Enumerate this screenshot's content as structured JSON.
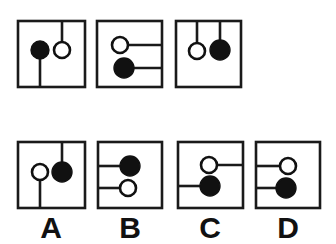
{
  "page": {
    "background_color": "#ffffff",
    "line_color": "#1a1a1a",
    "filled_node_color": "#111111",
    "open_node_color": "#ffffff"
  },
  "prompt_row": {
    "name": "question-row",
    "panels": [
      {
        "id": "q1",
        "box": {
          "x": 18,
          "y": 21,
          "w": 67,
          "h": 66
        },
        "elements": [
          {
            "kind": "line",
            "orientation": "vertical",
            "from_edge": "none",
            "to_edge": "bottom",
            "x": 40,
            "y1": 50,
            "y2": 87
          },
          {
            "kind": "line",
            "orientation": "vertical",
            "from_edge": "top",
            "to_edge": "none",
            "x": 62,
            "y1": 21,
            "y2": 50
          },
          {
            "kind": "circle",
            "fill": "filled",
            "cx": 40,
            "cy": 50,
            "r": 9
          },
          {
            "kind": "circle",
            "fill": "open",
            "cx": 62,
            "cy": 50,
            "r": 8
          }
        ]
      },
      {
        "id": "q2",
        "box": {
          "x": 97,
          "y": 21,
          "w": 65,
          "h": 66
        },
        "elements": [
          {
            "kind": "line",
            "orientation": "horizontal",
            "from_edge": "none",
            "to_edge": "right",
            "y": 45,
            "x1": 120,
            "x2": 162
          },
          {
            "kind": "line",
            "orientation": "horizontal",
            "from_edge": "none",
            "to_edge": "right",
            "y": 68,
            "x1": 124,
            "x2": 162
          },
          {
            "kind": "circle",
            "fill": "open",
            "cx": 120,
            "cy": 45,
            "r": 8
          },
          {
            "kind": "circle",
            "fill": "filled",
            "cx": 124,
            "cy": 68,
            "r": 10
          }
        ]
      },
      {
        "id": "q3",
        "box": {
          "x": 176,
          "y": 21,
          "w": 65,
          "h": 66
        },
        "elements": [
          {
            "kind": "line",
            "orientation": "vertical",
            "from_edge": "top",
            "to_edge": "none",
            "x": 197,
            "y1": 21,
            "y2": 51
          },
          {
            "kind": "line",
            "orientation": "vertical",
            "from_edge": "top",
            "to_edge": "none",
            "x": 220,
            "y1": 21,
            "y2": 50
          },
          {
            "kind": "circle",
            "fill": "open",
            "cx": 197,
            "cy": 51,
            "r": 8
          },
          {
            "kind": "circle",
            "fill": "filled",
            "cx": 220,
            "cy": 50,
            "r": 10
          }
        ]
      }
    ]
  },
  "answer_row": {
    "name": "answer-options-row",
    "options": [
      {
        "id": "A",
        "label": "A",
        "label_x": 51,
        "label_y": 238,
        "box": {
          "x": 18,
          "y": 142,
          "w": 67,
          "h": 66
        },
        "elements": [
          {
            "kind": "line",
            "orientation": "vertical",
            "from_edge": "none",
            "to_edge": "bottom",
            "x": 40,
            "y1": 172,
            "y2": 208
          },
          {
            "kind": "line",
            "orientation": "vertical",
            "from_edge": "top",
            "to_edge": "none",
            "x": 62,
            "y1": 142,
            "y2": 172
          },
          {
            "kind": "circle",
            "fill": "open",
            "cx": 40,
            "cy": 172,
            "r": 8
          },
          {
            "kind": "circle",
            "fill": "filled",
            "cx": 62,
            "cy": 172,
            "r": 10
          }
        ]
      },
      {
        "id": "B",
        "label": "B",
        "label_x": 130,
        "label_y": 238,
        "box": {
          "x": 98,
          "y": 142,
          "w": 64,
          "h": 66
        },
        "elements": [
          {
            "kind": "line",
            "orientation": "horizontal",
            "from_edge": "left",
            "to_edge": "none",
            "y": 166,
            "x1": 98,
            "x2": 130
          },
          {
            "kind": "line",
            "orientation": "horizontal",
            "from_edge": "left",
            "to_edge": "none",
            "y": 188,
            "x1": 98,
            "x2": 128
          },
          {
            "kind": "circle",
            "fill": "filled",
            "cx": 130,
            "cy": 166,
            "r": 10
          },
          {
            "kind": "circle",
            "fill": "open",
            "cx": 128,
            "cy": 188,
            "r": 8
          }
        ]
      },
      {
        "id": "C",
        "label": "C",
        "label_x": 210,
        "label_y": 238,
        "box": {
          "x": 178,
          "y": 142,
          "w": 65,
          "h": 66
        },
        "elements": [
          {
            "kind": "line",
            "orientation": "horizontal",
            "from_edge": "none",
            "to_edge": "right",
            "y": 165,
            "x1": 209,
            "x2": 243
          },
          {
            "kind": "line",
            "orientation": "horizontal",
            "from_edge": "left",
            "to_edge": "none",
            "y": 186,
            "x1": 178,
            "x2": 210
          },
          {
            "kind": "circle",
            "fill": "open",
            "cx": 209,
            "cy": 165,
            "r": 8
          },
          {
            "kind": "circle",
            "fill": "filled",
            "cx": 210,
            "cy": 186,
            "r": 10
          }
        ]
      },
      {
        "id": "D",
        "label": "D",
        "label_x": 288,
        "label_y": 238,
        "box": {
          "x": 256,
          "y": 142,
          "w": 64,
          "h": 66
        },
        "elements": [
          {
            "kind": "line",
            "orientation": "horizontal",
            "from_edge": "left",
            "to_edge": "none",
            "y": 166,
            "x1": 256,
            "x2": 288
          },
          {
            "kind": "line",
            "orientation": "horizontal",
            "from_edge": "left",
            "to_edge": "none",
            "y": 188,
            "x1": 256,
            "x2": 286
          },
          {
            "kind": "circle",
            "fill": "open",
            "cx": 288,
            "cy": 166,
            "r": 8
          },
          {
            "kind": "circle",
            "fill": "filled",
            "cx": 286,
            "cy": 188,
            "r": 10
          }
        ]
      }
    ]
  }
}
